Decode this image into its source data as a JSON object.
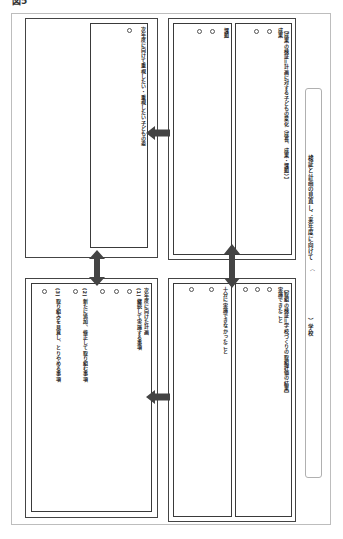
{
  "figure_label": "図5",
  "title": {
    "main": "検証と計画の見直し：来年度に向けて",
    "paren_open": "（",
    "school_suffix": "）学校"
  },
  "boxes": {
    "top_right": {
      "heading": "【成果の検証＝計画に対する子どもの変化（成長、成果・課題）】",
      "subheading": "成果",
      "bullets": [
        "○",
        "○"
      ]
    },
    "top_right_left": {
      "heading": "課題",
      "bullets": [
        "○",
        "○"
      ]
    },
    "bottom_right": {
      "heading": "【取組の検証＝学校づくりの取組評価の結果】",
      "subheading": "実施できたこと",
      "bullets": [
        "○",
        "○",
        "○"
      ]
    },
    "bottom_right_left": {
      "heading": "十分に実施できなかったこと",
      "bullets": [
        "○",
        "○"
      ]
    },
    "top_left": {
      "heading": "次年度に向けて重視したい・重視したい子どもの姿",
      "bullets": [
        "○"
      ]
    },
    "bottom_left": {
      "heading": "次年度に向けた計画",
      "sections": [
        {
          "label": "(1) 継続して実施する事項",
          "bullets": [
            "○",
            "○",
            "○"
          ]
        },
        {
          "label": "(2) 新たに追加、修正して取り組む事項",
          "bullets": [
            "○",
            "○"
          ]
        },
        {
          "label": "(3) 取り組みを見直し、とりやめる事項",
          "bullets": [
            "○"
          ]
        }
      ]
    }
  },
  "arrows": [
    {
      "name": "arrow-top-right-to-top-left",
      "direction": "left"
    },
    {
      "name": "arrow-bottom-right-to-bottom-left",
      "direction": "left"
    },
    {
      "name": "arrow-right-groups-vertical",
      "direction": "both-vertical"
    },
    {
      "name": "arrow-left-groups-vertical",
      "direction": "both-vertical"
    }
  ],
  "colors": {
    "border": "#3a3a3a",
    "arrow": "#444444",
    "frame": "#bdbdbd"
  }
}
